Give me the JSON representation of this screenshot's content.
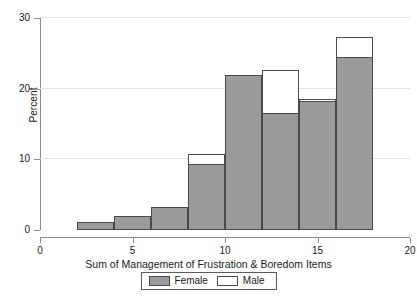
{
  "chart_data": {
    "type": "bar",
    "title": "",
    "xlabel": "Sum of Management of Frustration & Boredom Items",
    "ylabel": "Percent",
    "xlim": [
      0,
      20
    ],
    "ylim": [
      0,
      30
    ],
    "xticks": [
      "0",
      "5",
      "10",
      "15",
      "20"
    ],
    "xtick_values": [
      0,
      5,
      10,
      15,
      20
    ],
    "yticks": [
      "0",
      "10",
      "20",
      "30"
    ],
    "ytick_values": [
      0,
      10,
      20,
      30
    ],
    "grid": "horizontal",
    "bin_width": 2,
    "bin_starts": [
      2,
      4,
      6,
      8,
      10,
      12,
      14,
      16
    ],
    "categories": [
      "2-4",
      "4-6",
      "6-8",
      "8-10",
      "10-12",
      "12-14",
      "14-16",
      "16-18"
    ],
    "legend_position": "bottom",
    "series": [
      {
        "name": "Female",
        "color": "#9b9b9b",
        "values": [
          1.2,
          2.0,
          3.2,
          9.4,
          22.0,
          16.6,
          18.3,
          24.5
        ]
      },
      {
        "name": "Male",
        "color": "#ffffff",
        "values": [
          1.2,
          2.0,
          3.2,
          10.8,
          22.0,
          22.6,
          18.6,
          27.3
        ]
      }
    ]
  },
  "legend": {
    "female_label": "Female",
    "male_label": "Male"
  }
}
